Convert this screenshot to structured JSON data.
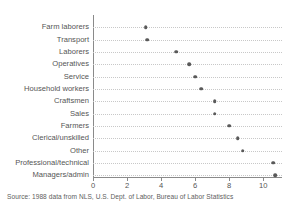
{
  "chart_data": {
    "type": "scatter",
    "orientation": "horizontal",
    "title": "",
    "xlabel": "",
    "ylabel": "",
    "xlim": [
      0,
      11.1
    ],
    "ylim": [
      0,
      14
    ],
    "grid": true,
    "grid_style": "dotted-horizontal",
    "legend": null,
    "marker_color": "#595959",
    "axis_color": "#8a8a8a",
    "grid_color": "#c8c8c8",
    "xticks": [
      0,
      2,
      4,
      6,
      8,
      10
    ],
    "xtick_labels": [
      "0",
      "2",
      "4",
      "6",
      "8",
      "10"
    ],
    "categories": [
      "Farm laborers",
      "Transport",
      "Laborers",
      "Operatives",
      "Service",
      "Household workers",
      "Craftsmen",
      "Sales",
      "Farmers",
      "Clerical/unskilled",
      "Other",
      "Professional/technical",
      "Managers/admin"
    ],
    "values": [
      3.1,
      3.2,
      4.9,
      5.65,
      6.0,
      6.35,
      7.15,
      7.15,
      8.0,
      8.5,
      8.8,
      10.6,
      10.7
    ]
  },
  "footer": {
    "source_note": "Source:  1988 data from NLS, U.S. Dept. of Labor, Bureau of Labor Statistics"
  }
}
